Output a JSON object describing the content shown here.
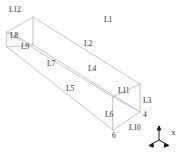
{
  "figure": {
    "type": "wireframe-3d-beam",
    "background_color": "#ffffff",
    "line_color": "#b4b4b4",
    "text_color": "#2b2b2b"
  },
  "edge_labels": [
    {
      "id": "L1",
      "text": "L1",
      "x": 104,
      "y": 16
    },
    {
      "id": "L2",
      "text": "L2",
      "x": 84,
      "y": 40
    },
    {
      "id": "L3",
      "text": "L3",
      "x": 143,
      "y": 97
    },
    {
      "id": "L4",
      "text": "L4",
      "x": 88,
      "y": 65
    },
    {
      "id": "L5",
      "text": "L5",
      "x": 66,
      "y": 85
    },
    {
      "id": "L6",
      "text": "L6",
      "x": 105,
      "y": 111
    },
    {
      "id": "L7",
      "text": "L7",
      "x": 47,
      "y": 60
    },
    {
      "id": "L8",
      "text": "L8",
      "x": 10,
      "y": 32
    },
    {
      "id": "L9",
      "text": "L9",
      "x": 21,
      "y": 43
    },
    {
      "id": "L10",
      "text": "L10",
      "x": 129,
      "y": 124
    },
    {
      "id": "L11",
      "text": "L11",
      "x": 118,
      "y": 87
    },
    {
      "id": "L12",
      "text": "L12",
      "x": 9,
      "y": 6
    }
  ],
  "node_labels": [
    {
      "id": "node-4",
      "text": "4",
      "x": 143,
      "y": 111
    },
    {
      "id": "node-6",
      "text": "6",
      "x": 112,
      "y": 132
    }
  ],
  "axis_triad": {
    "labels": [
      {
        "id": "axis-x",
        "text": "X",
        "x": 23,
        "y": 6
      }
    ]
  },
  "geometry": {
    "note": "Projected 2D coordinates of the 8 box corners, in pixels",
    "near_face": {
      "top_left": [
        7,
        32
      ],
      "top_right": [
        33,
        17
      ],
      "bottom_right": [
        33,
        45
      ],
      "bottom_left": [
        7,
        47
      ]
    },
    "far_face": {
      "top_left": [
        113,
        97
      ],
      "top_right": [
        140,
        84
      ],
      "bottom_right": [
        140,
        112
      ],
      "bottom_left": [
        113,
        130
      ]
    }
  }
}
